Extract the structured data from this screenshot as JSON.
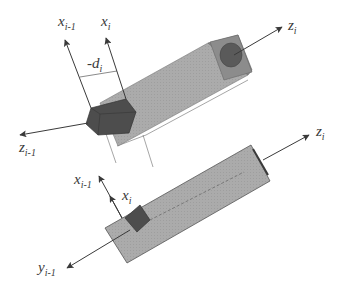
{
  "diagram": {
    "colors": {
      "background": "#ffffff",
      "link_body": "#a9a9a9",
      "link_end": "#8a8a8a",
      "joint_block": "#4d4d4d",
      "axis_line": "#3a3a3a",
      "label": "#3a3a3a"
    },
    "top_view": {
      "labels": {
        "x_prev": {
          "base": "x",
          "sub": "i-1"
        },
        "x_curr": {
          "base": "x",
          "sub": "i"
        },
        "offset": {
          "base": "-d",
          "sub": "i"
        },
        "z_prev": {
          "base": "z",
          "sub": "i-1"
        },
        "z_curr": {
          "base": "z",
          "sub": "i"
        }
      }
    },
    "bottom_view": {
      "labels": {
        "x_prev": {
          "base": "x",
          "sub": "i-1"
        },
        "x_curr": {
          "base": "x",
          "sub": "i"
        },
        "y_prev": {
          "base": "y",
          "sub": "i-1"
        },
        "z_curr": {
          "base": "z",
          "sub": "i"
        }
      }
    }
  }
}
